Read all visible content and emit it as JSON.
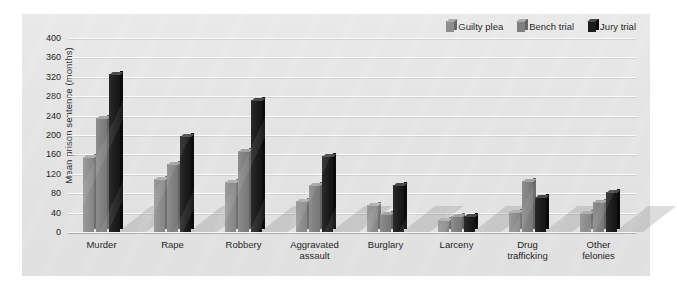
{
  "chart_data": {
    "type": "bar",
    "title": "",
    "xlabel": "",
    "ylabel": "Mean prison sentence (months)",
    "ylim": [
      0,
      400
    ],
    "ytick_step": 40,
    "yticks": [
      400,
      360,
      320,
      280,
      240,
      200,
      160,
      120,
      80,
      40,
      0
    ],
    "grid": true,
    "legend_position": "top-right",
    "categories": [
      "Murder",
      "Rape",
      "Robbery",
      "Aggravated\nassault",
      "Burglary",
      "Larceny",
      "Drug\ntrafficking",
      "Other\nfelonies"
    ],
    "series": [
      {
        "name": "Guilty plea",
        "color": "#8e8e8e",
        "values": [
          155,
          110,
          103,
          63,
          55,
          25,
          42,
          40
        ]
      },
      {
        "name": "Bench trial",
        "color": "#808080",
        "values": [
          235,
          140,
          167,
          97,
          37,
          33,
          105,
          62
        ]
      },
      {
        "name": "Jury trial",
        "color": "#1c1c1c",
        "values": [
          325,
          198,
          272,
          157,
          97,
          33,
          72,
          82
        ]
      }
    ]
  },
  "legend": {
    "items": [
      {
        "label": "Guilty plea"
      },
      {
        "label": "Bench trial"
      },
      {
        "label": "Jury trial"
      }
    ]
  }
}
